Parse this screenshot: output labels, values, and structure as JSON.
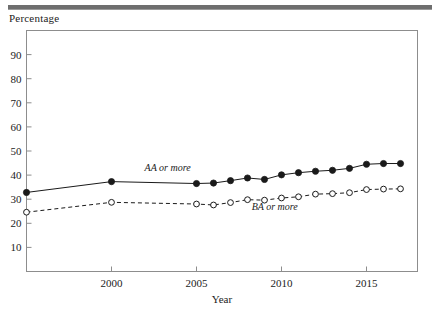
{
  "figure": {
    "y_axis_title": "Percentage",
    "x_axis_title": "Year"
  },
  "series_labels": {
    "aa": "AA or more",
    "ba": "BA or more"
  },
  "ticks": {
    "y": [
      "90",
      "80",
      "70",
      "60",
      "50",
      "40",
      "30",
      "20",
      "10"
    ],
    "x": [
      "2000",
      "2005",
      "2010",
      "2015"
    ]
  },
  "chart_data": {
    "type": "line",
    "title": "",
    "xlabel": "Year",
    "ylabel": "Percentage",
    "xlim": [
      1995,
      2018
    ],
    "ylim": [
      0,
      100
    ],
    "ytick_values": [
      10,
      20,
      30,
      40,
      50,
      60,
      70,
      80,
      90
    ],
    "xtick_values": [
      2000,
      2005,
      2010,
      2015
    ],
    "grid": false,
    "legend_position": "inline-annotation",
    "x": [
      1995,
      2000,
      2005,
      2006,
      2007,
      2008,
      2009,
      2010,
      2011,
      2012,
      2013,
      2014,
      2015,
      2016,
      2017
    ],
    "series": [
      {
        "name": "AA or more",
        "marker": "filled-circle",
        "line_style": "solid",
        "color": "#1a1a1a",
        "values": [
          32.8,
          37.3,
          36.5,
          36.7,
          37.7,
          38.8,
          38.2,
          40.1,
          41.0,
          41.6,
          42.0,
          42.8,
          44.5,
          44.8,
          44.8
        ]
      },
      {
        "name": "BA or more",
        "marker": "open-circle",
        "line_style": "dashed",
        "color": "#1a1a1a",
        "values": [
          24.6,
          28.7,
          28.0,
          27.6,
          28.6,
          29.8,
          29.6,
          30.5,
          31.0,
          32.1,
          32.3,
          32.7,
          34.0,
          34.2,
          34.3
        ]
      }
    ],
    "annotations": [
      {
        "text": "AA or more",
        "x": 2003.3,
        "y": 41.5
      },
      {
        "text": "BA or more",
        "x": 2009.6,
        "y": 25.6
      }
    ]
  }
}
